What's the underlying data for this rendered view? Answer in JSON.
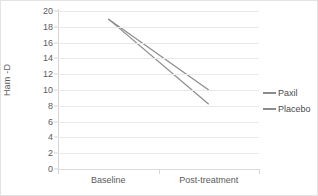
{
  "chart_data": {
    "type": "line",
    "title": "",
    "xlabel": "",
    "ylabel": "Ham -D",
    "categories": [
      "Baseline",
      "Post-treatment"
    ],
    "ylim": [
      0,
      20
    ],
    "yticks": [
      0,
      2,
      4,
      6,
      8,
      10,
      12,
      14,
      16,
      18,
      20
    ],
    "ytick_labels": [
      "0",
      "2",
      "4",
      "6",
      "8",
      "10",
      "12",
      "14",
      "16",
      "18",
      "20"
    ],
    "grid": true,
    "legend_position": "right",
    "series": [
      {
        "name": "Paxil",
        "values": [
          19.0,
          10.0
        ],
        "color": "#8c8c8c"
      },
      {
        "name": "Placebo",
        "values": [
          19.0,
          8.2
        ],
        "color": "#8c8c8c"
      }
    ]
  },
  "legend": {
    "items": [
      {
        "label": "Paxil",
        "color": "#8c8c8c"
      },
      {
        "label": "Placebo",
        "color": "#8c8c8c"
      }
    ]
  },
  "axes": {
    "y_title": "Ham -D",
    "x_categories": [
      "Baseline",
      "Post-treatment"
    ]
  },
  "colors": {
    "gridline": "#e9e9e9",
    "axis": "#d4d4d4",
    "text": "#5a5a5a",
    "border": "#e3e3e3",
    "series": "#8c8c8c"
  }
}
